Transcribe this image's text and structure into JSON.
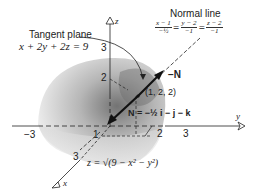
{
  "figure": {
    "tangent_plane": {
      "title": "Tangent plane",
      "equation": "x + 2y + 2z = 9"
    },
    "normal_line": {
      "title": "Normal line",
      "fractions": [
        {
          "num": "x − 1",
          "den": "−½"
        },
        {
          "num": "y − 2",
          "den": "−1"
        },
        {
          "num": "z − 2",
          "den": "−1"
        }
      ],
      "equals": "="
    },
    "vectors": {
      "neg_N": "−N",
      "N_expr": "N = −½ i − j − k"
    },
    "point": "(1, 2, 2)",
    "surface": "z = √(9 − x² − y²)",
    "axes": {
      "x_label": "x",
      "y_label": "y",
      "z_label": "z"
    },
    "ticks": {
      "z3": "3",
      "z2": "2",
      "x1": "1",
      "x3": "3",
      "y2": "2",
      "y3": "3",
      "yneg3": "−3"
    },
    "colors": {
      "surface_light": "#e6e6e6",
      "surface_dark": "#8a8a8a",
      "line": "#222222"
    }
  }
}
